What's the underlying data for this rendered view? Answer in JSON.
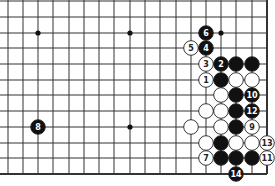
{
  "diagram": {
    "type": "go-board-fragment",
    "grid": {
      "columns_x": [
        8,
        23,
        38,
        53,
        69,
        84,
        99,
        114,
        130,
        145,
        160,
        176,
        191,
        206,
        221,
        236,
        252,
        267
      ],
      "rows_y": [
        1,
        17,
        33,
        48,
        64,
        80,
        95,
        111,
        127,
        143,
        158,
        174
      ],
      "right_edge": true,
      "bottom_edge": true,
      "line_color": "#333333",
      "edge_width": 2
    },
    "star_points": [
      {
        "col": 2,
        "row": 2
      },
      {
        "col": 8,
        "row": 2
      },
      {
        "col": 14,
        "row": 2
      },
      {
        "col": 8,
        "row": 8
      },
      {
        "col": 14,
        "row": 8
      }
    ],
    "stones": [
      {
        "col": 13,
        "row": 2,
        "color": "black",
        "label": "6"
      },
      {
        "col": 12,
        "row": 3,
        "color": "white",
        "label": "5"
      },
      {
        "col": 13,
        "row": 3,
        "color": "black",
        "label": "4"
      },
      {
        "col": 13,
        "row": 4,
        "color": "white",
        "label": "3"
      },
      {
        "col": 14,
        "row": 4,
        "color": "black",
        "label": "2"
      },
      {
        "col": 15,
        "row": 4,
        "color": "black",
        "label": ""
      },
      {
        "col": 16,
        "row": 4,
        "color": "black",
        "label": ""
      },
      {
        "col": 13,
        "row": 5,
        "color": "white",
        "label": "1"
      },
      {
        "col": 14,
        "row": 5,
        "color": "black",
        "label": ""
      },
      {
        "col": 15,
        "row": 5,
        "color": "white",
        "label": ""
      },
      {
        "col": 16,
        "row": 5,
        "color": "white",
        "label": ""
      },
      {
        "col": 14,
        "row": 6,
        "color": "white",
        "label": ""
      },
      {
        "col": 15,
        "row": 6,
        "color": "black",
        "label": ""
      },
      {
        "col": 16,
        "row": 6,
        "color": "black",
        "label": "10"
      },
      {
        "col": 13,
        "row": 7,
        "color": "white",
        "label": ""
      },
      {
        "col": 14,
        "row": 7,
        "color": "white",
        "label": ""
      },
      {
        "col": 15,
        "row": 7,
        "color": "black",
        "label": ""
      },
      {
        "col": 16,
        "row": 7,
        "color": "black",
        "label": "12"
      },
      {
        "col": 2,
        "row": 8,
        "color": "black",
        "label": "8"
      },
      {
        "col": 12,
        "row": 8,
        "color": "white",
        "label": ""
      },
      {
        "col": 14,
        "row": 8,
        "color": "white",
        "label": ""
      },
      {
        "col": 15,
        "row": 8,
        "color": "black",
        "label": ""
      },
      {
        "col": 16,
        "row": 8,
        "color": "white",
        "label": "9"
      },
      {
        "col": 13,
        "row": 9,
        "color": "white",
        "label": ""
      },
      {
        "col": 14,
        "row": 9,
        "color": "black",
        "label": ""
      },
      {
        "col": 15,
        "row": 9,
        "color": "white",
        "label": ""
      },
      {
        "col": 16,
        "row": 9,
        "color": "white",
        "label": ""
      },
      {
        "col": 17,
        "row": 9,
        "color": "white",
        "label": "13"
      },
      {
        "col": 13,
        "row": 10,
        "color": "white",
        "label": "7"
      },
      {
        "col": 14,
        "row": 10,
        "color": "black",
        "label": ""
      },
      {
        "col": 15,
        "row": 10,
        "color": "black",
        "label": ""
      },
      {
        "col": 16,
        "row": 10,
        "color": "black",
        "label": ""
      },
      {
        "col": 17,
        "row": 10,
        "color": "white",
        "label": "11"
      },
      {
        "col": 15,
        "row": 11,
        "color": "black",
        "label": "14"
      }
    ],
    "colors": {
      "black_stone": "#111111",
      "white_stone": "#ffffff",
      "stone_outline": "#222222",
      "label_on_black": "#ffffff",
      "label_on_white": "#222222"
    }
  }
}
